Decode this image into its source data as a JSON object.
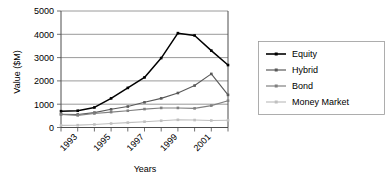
{
  "chart_data": {
    "type": "line",
    "title": "",
    "xlabel": "Years",
    "ylabel": "Value ($M)",
    "x": [
      1992,
      1993,
      1994,
      1995,
      1996,
      1997,
      1998,
      1999,
      2000,
      2001,
      2002
    ],
    "xtick_labels": [
      "",
      "1993",
      "",
      "1995",
      "",
      "1997",
      "",
      "1999",
      "",
      "2001",
      ""
    ],
    "xtick_labels_visible": [
      "1993",
      "1995",
      "1997",
      "1999",
      "2001"
    ],
    "ytick_labels": [
      "0",
      "1000",
      "2000",
      "3000",
      "4000",
      "5000"
    ],
    "yticks": [
      0,
      1000,
      2000,
      3000,
      4000,
      5000
    ],
    "ylim": [
      0,
      5000
    ],
    "grid": true,
    "legend_position": "right",
    "series": [
      {
        "name": "Equity",
        "color": "#000000",
        "values": [
          700,
          720,
          860,
          1250,
          1700,
          2150,
          2980,
          4050,
          3950,
          3300,
          2680
        ]
      },
      {
        "name": "Hybrid",
        "color": "#595959",
        "values": [
          570,
          560,
          640,
          780,
          900,
          1080,
          1250,
          1480,
          1800,
          2300,
          1400
        ]
      },
      {
        "name": "Bond",
        "color": "#808080",
        "values": [
          560,
          520,
          600,
          660,
          720,
          790,
          840,
          840,
          820,
          940,
          1150
        ]
      },
      {
        "name": "Money Market",
        "color": "#bfbfbf",
        "values": [
          90,
          100,
          130,
          170,
          210,
          250,
          290,
          330,
          320,
          300,
          310
        ]
      }
    ]
  },
  "legend": {
    "entries": [
      {
        "label": "Equity",
        "color": "#000000"
      },
      {
        "label": "Hybrid",
        "color": "#595959"
      },
      {
        "label": "Bond",
        "color": "#808080"
      },
      {
        "label": "Money Market",
        "color": "#bfbfbf"
      }
    ]
  },
  "axes": {
    "y_title": "Value ($M)",
    "x_title": "Years"
  }
}
